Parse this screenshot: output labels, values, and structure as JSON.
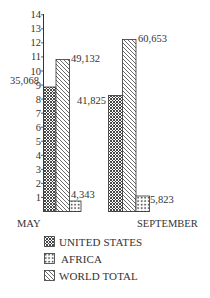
{
  "chart_data": {
    "type": "bar",
    "title": "",
    "xlabel": "",
    "ylabel": "",
    "categories": [
      "MAY",
      "SEPTEMBER"
    ],
    "series": [
      {
        "name": "UNITED STATES",
        "pattern": "crosshatch",
        "values": [
          35068,
          41825
        ],
        "axis_heights": [
          9,
          8.4
        ]
      },
      {
        "name": "WORLD TOTAL",
        "pattern": "diagonal",
        "values": [
          49132,
          60653
        ],
        "axis_heights": [
          11,
          12.6
        ]
      },
      {
        "name": "AFRICA",
        "pattern": "dots-grid",
        "values": [
          4343,
          5823
        ],
        "axis_heights": [
          0.75,
          1.1
        ]
      }
    ],
    "data_labels": {
      "may": {
        "united_states": "35,068",
        "world_total": "49,132",
        "africa": "4,343"
      },
      "september": {
        "united_states": "41,825",
        "world_total": "60,653",
        "africa": "5,823"
      }
    },
    "y_ticks": [
      "1",
      "2",
      "3",
      "4",
      "5",
      "6",
      "7",
      "8",
      "9",
      "10",
      "11",
      "12",
      "13",
      "14"
    ],
    "ylim": [
      0,
      14
    ],
    "grid": false,
    "legend_position": "bottom"
  },
  "legend": {
    "items": [
      {
        "label": "UNITED STATES"
      },
      {
        "label": "AFRICA"
      },
      {
        "label": "WORLD TOTAL"
      }
    ]
  }
}
